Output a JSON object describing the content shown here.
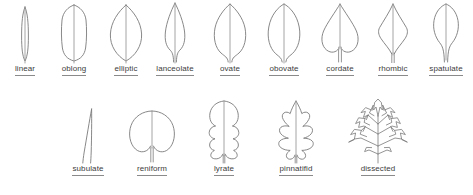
{
  "figure": {
    "background_color": "#ffffff",
    "outline_color": "#7a7a7a",
    "label_color": "#3c3c3c",
    "label_underline_color": "#8a8a8a"
  },
  "rows": [
    {
      "row_index": 0,
      "leaves": [
        {
          "label": "linear",
          "shape": "linear",
          "description": "very narrow, parallel-sided blade"
        },
        {
          "label": "oblong",
          "shape": "oblong",
          "description": "parallel-sided blade, rounded ends"
        },
        {
          "label": "elliptic",
          "shape": "elliptic",
          "description": "widest at the middle, tapering equally at both ends"
        },
        {
          "label": "lanceolate",
          "shape": "lanceolate",
          "description": "lance-shaped, widest below the middle, long taper to tip"
        },
        {
          "label": "ovate",
          "shape": "ovate",
          "description": "egg-shaped, widest below the middle"
        },
        {
          "label": "obovate",
          "shape": "obovate",
          "description": "inverted egg-shaped, widest above the middle"
        },
        {
          "label": "cordate",
          "shape": "cordate",
          "description": "heart-shaped with a notched base"
        },
        {
          "label": "rhombic",
          "shape": "rhombic",
          "description": "diamond-shaped with angular sides"
        },
        {
          "label": "spatulate",
          "shape": "spatulate",
          "description": "spoon-shaped, broad tip narrowing to the base"
        }
      ]
    },
    {
      "row_index": 1,
      "leaves": [
        {
          "label": "subulate",
          "shape": "subulate",
          "description": "awl-shaped, very slender and tapering"
        },
        {
          "label": "reniform",
          "shape": "reniform",
          "description": "kidney-shaped, broad and rounded with basal notch"
        },
        {
          "label": "lyrate",
          "shape": "lyrate",
          "description": "lyre-shaped, large rounded terminal lobe with smaller lower lobes"
        },
        {
          "label": "pinnatifid",
          "shape": "pinnatifid",
          "description": "deeply lobed along the midrib"
        },
        {
          "label": "dissected",
          "shape": "dissected",
          "description": "finely divided into narrow segments"
        }
      ]
    }
  ]
}
